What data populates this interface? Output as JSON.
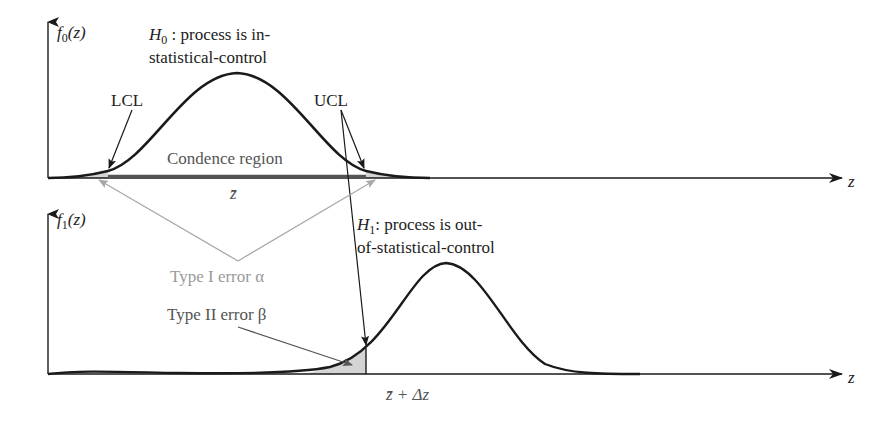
{
  "top_panel": {
    "y_axis_label": "f",
    "y_axis_sub": "0",
    "y_axis_arg": "(z)",
    "x_axis_label": "z",
    "hypothesis_symbol": "H",
    "hypothesis_sub": "0",
    "hypothesis_line1": " : process is in-",
    "hypothesis_line2": "statistical-control",
    "lcl_label": "LCL",
    "ucl_label": "UCL",
    "region_label": "Condence region",
    "mean_label": "z̄"
  },
  "bottom_panel": {
    "y_axis_label": "f",
    "y_axis_sub": "1",
    "y_axis_arg": "(z)",
    "x_axis_label": "z",
    "hypothesis_symbol": "H",
    "hypothesis_sub": "1",
    "hypothesis_line1": ": process is out-",
    "hypothesis_line2": "of-statistical-control",
    "shift_label": "z̄ + Δz"
  },
  "annotations": {
    "type1_label": "Type I error α",
    "type2_label": "Type II error β"
  },
  "colors": {
    "curve": "#1a1a1a",
    "region_bar": "#555555",
    "type1": "#a8a8a8",
    "tail_fill": "#d4d4d4"
  }
}
